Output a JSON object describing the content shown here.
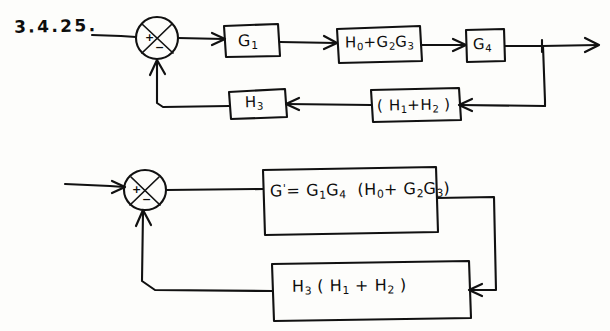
{
  "page": {
    "title": "3.4.25.",
    "background_color": "#fdfdfb",
    "ink_color": "#111111"
  },
  "problem_label": "3.4.25.",
  "diagrams": [
    {
      "name": "original-block-diagram",
      "summing_junction": {
        "name": "summing-junction-1",
        "signs": {
          "input": "+",
          "feedback": "−"
        }
      },
      "forward_blocks": [
        {
          "id": "g1",
          "label_html": "G1",
          "label": "G₁"
        },
        {
          "id": "h0-plus-g2g3",
          "label": "H₀ + G₂G₃"
        },
        {
          "id": "g4",
          "label": "G₄"
        }
      ],
      "feedback_blocks": [
        {
          "id": "h3",
          "label": "H₃"
        },
        {
          "id": "h1-plus-h2",
          "label": "( H₁ + H₂ )"
        }
      ],
      "signal_flow": "input → sum → G1 → H0+G2G3 → G4 → output; takeoff → (H1+H2) → H3 → sum"
    },
    {
      "name": "reduced-block-diagram",
      "summing_junction": {
        "name": "summing-junction-2",
        "signs": {
          "input": "+",
          "feedback": "−"
        }
      },
      "forward_blocks": [
        {
          "id": "g-prime",
          "label": "G' = G₁G₄ (H₀ + G₂G₃)"
        }
      ],
      "feedback_blocks": [
        {
          "id": "h3-h1-h2",
          "label": "H₃ ( H₁ + H₂ )"
        }
      ],
      "signal_flow": "input → sum → G' → output; feedback → H3(H1+H2) → sum"
    }
  ],
  "labels": {
    "g1": "G1",
    "h0g2g3": "H0+G2G3",
    "g4": "G4",
    "h3": "H3",
    "h1h2": "(H1+H2)",
    "gprime": "G'=G1G4(H0+G2G3)",
    "h3h1h2": "H3(H1+H2)",
    "plus": "+",
    "minus": "−"
  }
}
